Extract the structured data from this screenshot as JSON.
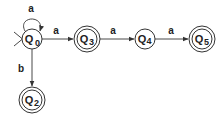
{
  "diagram": {
    "type": "finite-automaton",
    "colors": {
      "stroke": "#333333",
      "text": "#222222",
      "background": "#ffffff"
    },
    "start_state": "q0",
    "states": [
      {
        "id": "q0",
        "letter": "Q",
        "index": "0",
        "accepting": false,
        "cx": 32,
        "cy": 39
      },
      {
        "id": "q3",
        "letter": "Q",
        "index": "3",
        "accepting": true,
        "cx": 87,
        "cy": 39
      },
      {
        "id": "q4",
        "letter": "Q",
        "index": "4",
        "accepting": false,
        "cx": 145,
        "cy": 39
      },
      {
        "id": "q5",
        "letter": "Q",
        "index": "5",
        "accepting": true,
        "cx": 202,
        "cy": 39
      },
      {
        "id": "q2",
        "letter": "Q",
        "index": "2",
        "accepting": true,
        "cx": 32,
        "cy": 100
      }
    ],
    "transitions": [
      {
        "from": "q0",
        "to": "q0",
        "label": "a"
      },
      {
        "from": "q0",
        "to": "q3",
        "label": "a"
      },
      {
        "from": "q3",
        "to": "q4",
        "label": "a"
      },
      {
        "from": "q4",
        "to": "q5",
        "label": "a"
      },
      {
        "from": "q0",
        "to": "q2",
        "label": "b"
      }
    ]
  }
}
